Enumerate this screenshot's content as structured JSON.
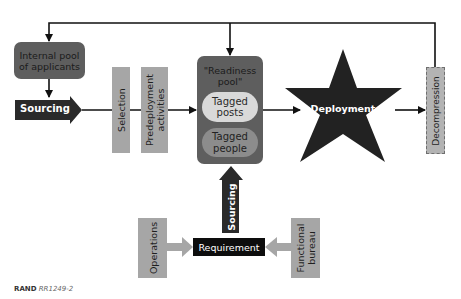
{
  "diagram": {
    "nodes": {
      "internal_pool": "Internal pool\nof applicants",
      "sourcing_left": "Sourcing",
      "selection": "Selection",
      "predeployment": "Predeployment\nactivities",
      "readiness_pool_title": "\"Readiness\npool\"",
      "tagged_posts": "Tagged\nposts",
      "tagged_people": "Tagged\npeople",
      "deployment": "Deployment",
      "decompression": "Decompression",
      "sourcing_up": "Sourcing",
      "requirement": "Requirement",
      "operations": "Operations",
      "functional_bureau": "Functional\nbureau"
    },
    "colors": {
      "dark_box": "#5e5e5e",
      "black": "#1a1a1a",
      "gray_bar": "#a6a6a6",
      "pill_light": "#d9d9d9",
      "pill_mid": "#8c8c8c",
      "decompression": "#b3b3b3"
    }
  },
  "footer": {
    "source_bold": "RAND",
    "source_id": "RR1249-2"
  }
}
